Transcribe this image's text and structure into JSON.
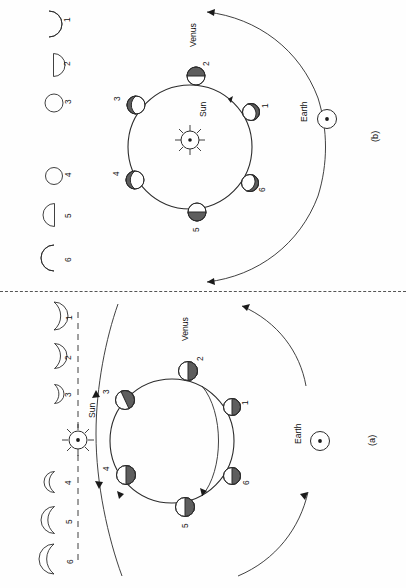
{
  "figure": {
    "orientation": "rotated-90-ccw",
    "divider": "dashed-horizontal-separator"
  },
  "panels": [
    {
      "id": "b",
      "label": "(b)",
      "position": "top",
      "sun_label": "Sun",
      "earth_label": "Earth",
      "venus_label": "Venus",
      "configuration": "Venus orbit far side of Sun (superior conjunction geometry)",
      "positions": [
        {
          "num": "1",
          "phase": "gibbous",
          "dark_side": "upper-right"
        },
        {
          "num": "2",
          "phase": "gibbous",
          "dark_side": "top"
        },
        {
          "num": "3",
          "phase": "gibbous",
          "dark_side": "upper-left"
        },
        {
          "num": "4",
          "phase": "gibbous",
          "dark_side": "left"
        },
        {
          "num": "5",
          "phase": "gibbous",
          "dark_side": "bottom"
        },
        {
          "num": "6",
          "phase": "gibbous",
          "dark_side": "lower-right"
        }
      ],
      "phase_icons": [
        {
          "num": "1",
          "shape": "crescent-thin",
          "size": 16
        },
        {
          "num": "2",
          "shape": "half-disc",
          "size": 14
        },
        {
          "num": "3",
          "shape": "full-disc",
          "size": 11
        },
        {
          "num": "4",
          "shape": "full-disc",
          "size": 11
        },
        {
          "num": "5",
          "shape": "half-disc",
          "size": 14
        },
        {
          "num": "6",
          "shape": "crescent-thin",
          "size": 16
        }
      ],
      "arrows": [
        "outer-arc-arrow-top-left",
        "outer-arc-arrow-bottom-left"
      ]
    },
    {
      "id": "a",
      "label": "(a)",
      "position": "bottom",
      "sun_label": "Sun",
      "earth_label": "Earth",
      "venus_label": "Venus",
      "configuration": "Venus orbit near side between Sun and Earth (inferior conjunction geometry)",
      "positions": [
        {
          "num": "1",
          "phase": "half-crescent",
          "dark_side": "right"
        },
        {
          "num": "2",
          "phase": "half-crescent",
          "dark_side": "right"
        },
        {
          "num": "3",
          "phase": "half-crescent",
          "dark_side": "upper-right"
        },
        {
          "num": "4",
          "phase": "half-crescent",
          "dark_side": "right"
        },
        {
          "num": "5",
          "phase": "half-crescent",
          "dark_side": "right"
        },
        {
          "num": "6",
          "phase": "half-crescent",
          "dark_side": "right"
        }
      ],
      "phase_icons": [
        {
          "num": "1",
          "shape": "crescent-wide",
          "size": 18
        },
        {
          "num": "2",
          "shape": "crescent-wide",
          "size": 16
        },
        {
          "num": "3",
          "shape": "crescent-narrow",
          "size": 12
        },
        {
          "num": "4",
          "shape": "crescent-narrow",
          "size": 13
        },
        {
          "num": "5",
          "shape": "crescent-wide",
          "size": 17
        },
        {
          "num": "6",
          "shape": "crescent-wide",
          "size": 19
        }
      ],
      "arrows": [
        "outer-arc-arrow-top",
        "outer-arc-arrow-bottom",
        "dashed-sun-line"
      ]
    }
  ],
  "colors": {
    "stroke": "#2b2b2b",
    "dark_hemisphere": "#5e5e5e",
    "lit_hemisphere": "#ffffff",
    "background": "#fefefe",
    "divider": "#555555"
  }
}
